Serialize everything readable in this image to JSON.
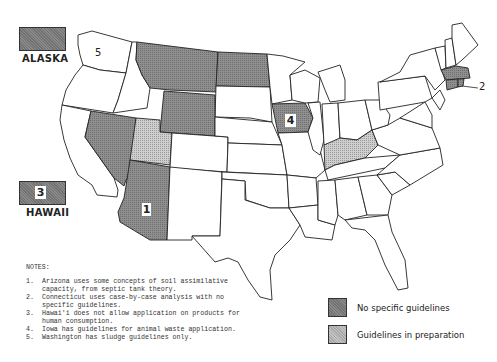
{
  "insets": {
    "alaska": {
      "label": "ALASKA",
      "category": "no_specific_guidelines"
    },
    "hawaii": {
      "label": "HAWAII",
      "category": "no_specific_guidelines",
      "note_number": "3"
    }
  },
  "map_labels": {
    "washington_note": "5",
    "arizona_note": "1",
    "iowa_note": "4",
    "connecticut_note": "2"
  },
  "states": {
    "no_specific_guidelines": [
      "Alaska",
      "Hawaii",
      "Montana",
      "North Dakota",
      "Wyoming",
      "Nevada",
      "Arizona",
      "Iowa",
      "Connecticut",
      "Massachusetts",
      "Rhode Island"
    ],
    "guidelines_in_preparation": [
      "Utah",
      "Kentucky"
    ]
  },
  "notes": {
    "title": "NOTES:",
    "items": [
      {
        "n": "1.",
        "text": "Arizona uses some concepts of soil assimilative capacity, from septic tank theory."
      },
      {
        "n": "2.",
        "text": "Connecticut uses case-by-case analysis with no specific guidelines."
      },
      {
        "n": "3.",
        "text": "Hawai'i does not allow application on products for human consumption."
      },
      {
        "n": "4.",
        "text": "Iowa has guidelines for animal waste application."
      },
      {
        "n": "5.",
        "text": "Washington has sludge guidelines only."
      }
    ]
  },
  "legend": {
    "items": [
      {
        "label": "No specific guidelines",
        "color": "#8a8a8a"
      },
      {
        "label": "Guidelines in preparation",
        "color": "#c4c4c4"
      }
    ]
  },
  "colors": {
    "dark_fill": "#8a8a8a",
    "light_fill": "#c4c4c4",
    "outline": "#222222"
  }
}
